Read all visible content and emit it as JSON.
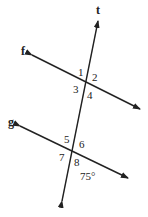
{
  "diagram": {
    "type": "parallel-lines-transversal",
    "colors": {
      "stroke": "#222222",
      "background": "#ffffff"
    },
    "lines": {
      "transversal": {
        "label": "t",
        "x1": 62,
        "y1": 201,
        "x2": 98,
        "y2": 21,
        "label_x": 96,
        "label_y": 14
      },
      "f": {
        "label": "f",
        "x1": 32,
        "y1": 55,
        "x2": 140,
        "y2": 109,
        "label_x": 21,
        "label_y": 55
      },
      "g": {
        "label": "g",
        "x1": 20,
        "y1": 126,
        "x2": 128,
        "y2": 178,
        "label_x": 8,
        "label_y": 126
      }
    },
    "angles": [
      {
        "id": "1",
        "label": "1",
        "x": 78,
        "y": 76
      },
      {
        "id": "2",
        "label": "2",
        "x": 92,
        "y": 81
      },
      {
        "id": "3",
        "label": "3",
        "x": 73,
        "y": 93
      },
      {
        "id": "4",
        "label": "4",
        "x": 87,
        "y": 99
      },
      {
        "id": "5",
        "label": "5",
        "x": 64,
        "y": 143
      },
      {
        "id": "6",
        "label": "6",
        "x": 79,
        "y": 148
      },
      {
        "id": "7",
        "label": "7",
        "x": 59,
        "y": 161
      },
      {
        "id": "8",
        "label": "8",
        "x": 74,
        "y": 166
      }
    ],
    "given_angle": {
      "label": "75°",
      "x": 80,
      "y": 180
    }
  }
}
